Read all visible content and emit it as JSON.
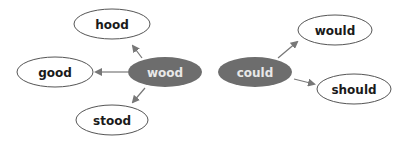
{
  "colors": {
    "hub_fill": "#6d6d6d",
    "hub_text": "#e8e8e8",
    "leaf_fill": "#ffffff",
    "leaf_stroke": "#555555",
    "leaf_text": "#1a1a1a",
    "arrow": "#777777"
  },
  "diagram": {
    "hubs": [
      {
        "id": "wood",
        "label": "wood"
      },
      {
        "id": "could",
        "label": "could"
      }
    ],
    "leaves": [
      {
        "id": "hood",
        "label": "hood",
        "from": "wood"
      },
      {
        "id": "good",
        "label": "good",
        "from": "wood"
      },
      {
        "id": "stood",
        "label": "stood",
        "from": "wood"
      },
      {
        "id": "would",
        "label": "would",
        "from": "could"
      },
      {
        "id": "should",
        "label": "should",
        "from": "could"
      }
    ]
  }
}
